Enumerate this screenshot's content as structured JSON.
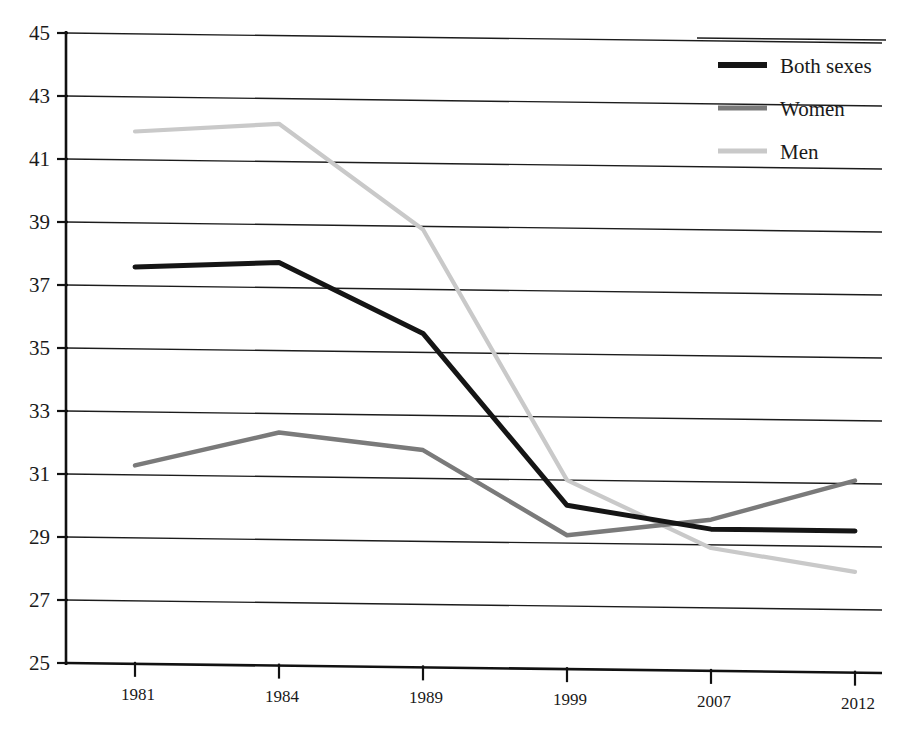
{
  "chart_data": {
    "type": "line",
    "title": "",
    "subtitle": "",
    "xlabel": "",
    "ylabel": "",
    "categories": [
      "1981",
      "1984",
      "1989",
      "1999",
      "2007",
      "2012"
    ],
    "ylim": [
      25,
      45
    ],
    "ytick_step": 2,
    "yticks": [
      "45",
      "43",
      "41",
      "39",
      "37",
      "35",
      "33",
      "31",
      "29",
      "27",
      "25"
    ],
    "ytick_values": [
      45,
      43,
      41,
      39,
      37,
      35,
      33,
      31,
      29,
      27,
      25
    ],
    "grid": true,
    "grid_axis": "y",
    "legend_position": "top-right",
    "series": [
      {
        "name": "Both sexes",
        "color": "#151515",
        "width": 5.0,
        "values": [
          37.6,
          37.8,
          35.6,
          30.2,
          29.5,
          29.5
        ]
      },
      {
        "name": "Women",
        "color": "#7a7a7a",
        "width": 4.4,
        "values": [
          31.3,
          32.4,
          31.9,
          29.25,
          29.8,
          31.1
        ]
      },
      {
        "name": "Men",
        "color": "#c9c9c9",
        "width": 4.2,
        "values": [
          41.9,
          42.2,
          38.9,
          31.0,
          28.9,
          28.2
        ]
      }
    ]
  },
  "legend": {
    "entries": [
      {
        "label": "Both sexes",
        "color": "#151515",
        "width": 6.0
      },
      {
        "label": "Women",
        "color": "#7a7a7a",
        "width": 5.2
      },
      {
        "label": "Men",
        "color": "#c9c9c9",
        "width": 5.0
      }
    ]
  },
  "axes": {
    "x_categories": [
      "1981",
      "1984",
      "1989",
      "1999",
      "2007",
      "2012"
    ],
    "y_labels": [
      "45",
      "43",
      "41",
      "39",
      "37",
      "35",
      "33",
      "31",
      "29",
      "27",
      "25"
    ]
  },
  "colors": {
    "both_sexes": "#151515",
    "women": "#7a7a7a",
    "men": "#c9c9c9",
    "axis": "#111111",
    "grid": "#1c1c1c",
    "background": "#ffffff"
  }
}
